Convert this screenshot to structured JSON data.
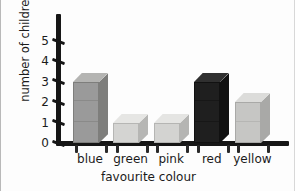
{
  "chart_data": {
    "type": "bar",
    "title": "",
    "subtitle": "",
    "xlabel": "favourite colour",
    "ylabel": "number of children",
    "categories": [
      "blue",
      "green",
      "pink",
      "red",
      "yellow"
    ],
    "values": [
      3,
      1,
      1,
      3,
      2
    ],
    "series": [
      {
        "name": "number of children",
        "values": [
          3,
          1,
          1,
          3,
          2
        ]
      }
    ],
    "ylim": [
      0,
      5
    ],
    "y_ticks": [
      "0",
      "1",
      "2",
      "3",
      "4",
      "5"
    ],
    "grid": false,
    "legend": "none",
    "style": "hand-drawn isometric 3-D blocks",
    "bar_colors": {
      "blue": "#9a9a9a",
      "green": "#d4d4d2",
      "pink": "#d3d3d1",
      "red": "#1f1f1f",
      "yellow": "#c6c6c4"
    },
    "bar_top_colors": {
      "blue": "#b4b4b2",
      "green": "#e6e6e4",
      "pink": "#e5e5e3",
      "red": "#303030",
      "yellow": "#dcdcda"
    },
    "bar_side_colors": {
      "blue": "#7e7e7c",
      "green": "#b6b6b4",
      "pink": "#b5b5b3",
      "red": "#111111",
      "yellow": "#a9a9a7"
    },
    "axis_color": "#161616",
    "text_color": "#1b1b1b",
    "background": "#fdfdfd"
  }
}
